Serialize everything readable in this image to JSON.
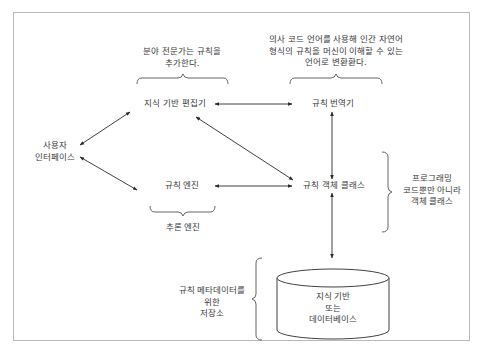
{
  "diagram": {
    "nodes": {
      "knowledge_editor": "지식 기반 편집기",
      "rule_translator": "규칙 번역기",
      "user_interface_line1": "사용자",
      "user_interface_line2": "인터페이스",
      "rule_engine": "규칙 엔진",
      "rule_object_class": "규칙 객체 클래스",
      "database_line1": "지식 기반",
      "database_line2": "또는",
      "database_line3": "데이터베이스"
    },
    "annotations": {
      "editor_note_line1": "분야 전문가는 규칙을",
      "editor_note_line2": "추가한다.",
      "translator_note_line1": "의사 코드 언어를 사용해 인간 자연어",
      "translator_note_line2": "형식의 규칙을 머신이 이해할 수 있는",
      "translator_note_line3": "언어로 변환환다.",
      "engine_group": "추론 엔진",
      "object_class_note_line1": "프로그래밍",
      "object_class_note_line2": "코드뿐만 아니라",
      "object_class_note_line3": "객체 클래스",
      "storage_note_line1": "규칙 메타데이터를",
      "storage_note_line2": "위한",
      "storage_note_line3": "저장소"
    },
    "edges": [
      {
        "from": "knowledge_editor",
        "to": "rule_translator",
        "type": "bidirectional"
      },
      {
        "from": "user_interface",
        "to": "knowledge_editor",
        "type": "bidirectional"
      },
      {
        "from": "user_interface",
        "to": "rule_engine",
        "type": "bidirectional"
      },
      {
        "from": "knowledge_editor",
        "to": "rule_object_class",
        "type": "bidirectional"
      },
      {
        "from": "rule_engine",
        "to": "rule_object_class",
        "type": "bidirectional"
      },
      {
        "from": "rule_translator",
        "to": "rule_object_class",
        "type": "bidirectional"
      },
      {
        "from": "rule_object_class",
        "to": "database",
        "type": "bidirectional"
      }
    ],
    "colors": {
      "line": "#2b2b2b",
      "brace": "#555555",
      "frame": "#b8b8b8",
      "text": "#3a3a3a"
    }
  }
}
